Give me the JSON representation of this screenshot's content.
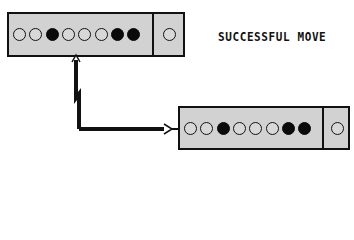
{
  "title": "SUCCESSFUL MOVE",
  "source_register": {
    "bits": [
      0,
      0,
      1,
      0,
      0,
      0,
      1,
      1
    ],
    "extra_bit": 0
  },
  "dest_register": {
    "bits": [
      0,
      0,
      1,
      0,
      0,
      0,
      1,
      1
    ],
    "extra_bit": 0
  },
  "colors": {
    "register_fill": "#d2d2d2",
    "outline": "#111111",
    "bit_on": "#0a0a0a",
    "bit_off": "#d8d8d8",
    "background": "#ffffff"
  },
  "icons": {
    "bit_off": "hollow-circle",
    "bit_on": "filled-circle",
    "connector": "arrow-right"
  }
}
